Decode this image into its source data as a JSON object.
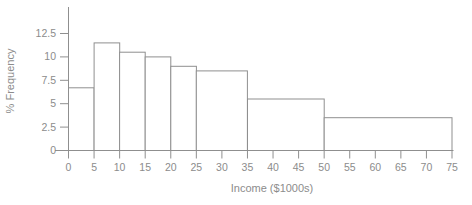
{
  "chart": {
    "xlabel": "Income ($1000s)",
    "ylabel": "% Frequency"
  },
  "chart_data": {
    "type": "bar",
    "subtype": "histogram",
    "title": "",
    "xlabel": "Income ($1000s)",
    "ylabel": "% Frequency",
    "bins": [
      {
        "range": [
          0,
          5
        ],
        "value": 6.7
      },
      {
        "range": [
          5,
          10
        ],
        "value": 11.5
      },
      {
        "range": [
          10,
          15
        ],
        "value": 10.5
      },
      {
        "range": [
          15,
          20
        ],
        "value": 10
      },
      {
        "range": [
          20,
          25
        ],
        "value": 9
      },
      {
        "range": [
          25,
          35
        ],
        "value": 8.5
      },
      {
        "range": [
          35,
          50
        ],
        "value": 5.5
      },
      {
        "range": [
          50,
          75
        ],
        "value": 3.5
      }
    ],
    "x_ticks": [
      0,
      5,
      10,
      15,
      20,
      25,
      30,
      35,
      40,
      45,
      50,
      55,
      60,
      65,
      70,
      75
    ],
    "y_ticks": [
      0,
      2.5,
      5,
      7.5,
      10,
      12.5
    ],
    "xlim": [
      0,
      75
    ],
    "ylim": [
      0,
      13.5
    ],
    "grid": false,
    "legend": null,
    "colors": {
      "bar_fill": "#ffffff",
      "line": "#8f8f8f",
      "text": "#8c8c8c"
    }
  }
}
